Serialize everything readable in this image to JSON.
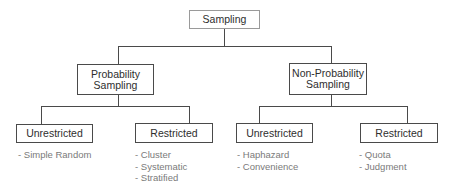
{
  "diagram": {
    "type": "tree",
    "root": {
      "label": "Sampling",
      "children": [
        {
          "label_line1": "Probability",
          "label_line2": "Sampling",
          "children": [
            {
              "label": "Unrestricted",
              "items": [
                "- Simple Random"
              ]
            },
            {
              "label": "Restricted",
              "items": [
                "- Cluster",
                "- Systematic",
                "- Stratified"
              ]
            }
          ]
        },
        {
          "label_line1": "Non-Probability",
          "label_line2": "Sampling",
          "children": [
            {
              "label": "Unrestricted",
              "items": [
                "- Haphazard",
                "- Convenience"
              ]
            },
            {
              "label": "Restricted",
              "items": [
                "- Quota",
                "- Judgment"
              ]
            }
          ]
        }
      ]
    }
  }
}
